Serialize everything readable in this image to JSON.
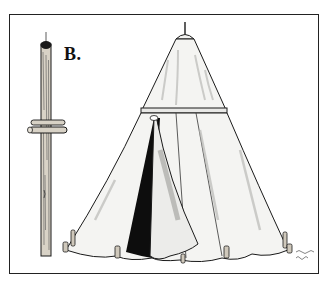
{
  "figure": {
    "label": "B.",
    "colors": {
      "ink": "#1a1a1a",
      "canvas": "#f4f4f2",
      "shade": "#b9b9b6",
      "door_dark": "#0d0d0d",
      "pole": "#d8d2c6",
      "frame": "#222222"
    }
  }
}
